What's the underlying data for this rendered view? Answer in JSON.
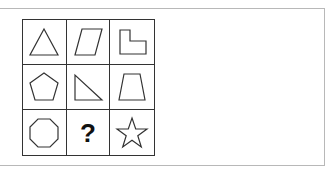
{
  "puzzle": {
    "rows": 3,
    "cols": 3,
    "cells": [
      {
        "row": 1,
        "col": 1,
        "shape": "triangle",
        "sides": 3
      },
      {
        "row": 1,
        "col": 2,
        "shape": "parallelogram",
        "sides": 4
      },
      {
        "row": 1,
        "col": 3,
        "shape": "l-shape",
        "sides": 6
      },
      {
        "row": 2,
        "col": 1,
        "shape": "pentagon",
        "sides": 5
      },
      {
        "row": 2,
        "col": 2,
        "shape": "right-triangle",
        "sides": 3
      },
      {
        "row": 2,
        "col": 3,
        "shape": "trapezoid",
        "sides": 4
      },
      {
        "row": 3,
        "col": 1,
        "shape": "octagon",
        "sides": 8
      },
      {
        "row": 3,
        "col": 2,
        "shape": "question",
        "label": "?"
      },
      {
        "row": 3,
        "col": 3,
        "shape": "star",
        "sides": 10
      }
    ],
    "missing_label": "?"
  },
  "colors": {
    "stroke": "#333333",
    "frame_border": "#b8b8b8",
    "background": "#ffffff"
  }
}
